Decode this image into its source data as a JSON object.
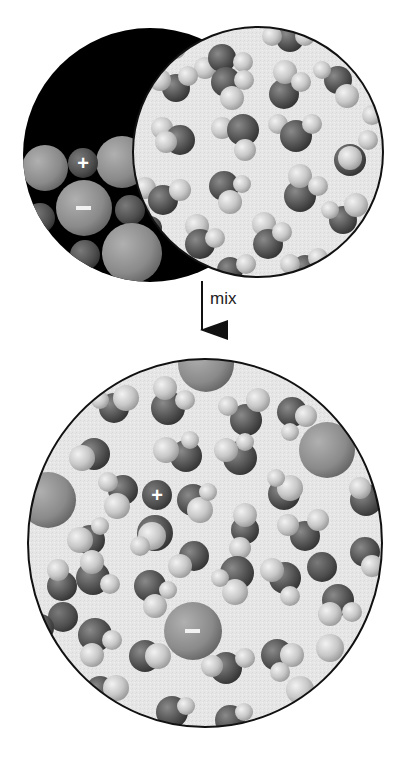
{
  "figure": {
    "type": "ionic-dissolution-diagram",
    "arrow_label": "mix",
    "colors": {
      "background": "#ffffff",
      "solid_background": "#000000",
      "solution_background": "#e6e6e6",
      "oxygen": "#555555",
      "hydrogen": "#cfcfcf",
      "anion": "#8a8a8a",
      "cation": "#505050",
      "outline": "#111111"
    },
    "top": {
      "solid_crystal": {
        "label": "ionic solid",
        "cation_symbol": "+",
        "anion_symbol": "−"
      },
      "water": {
        "label": "liquid water"
      }
    },
    "bottom": {
      "solution": {
        "label": "ions hydrated in water",
        "cation_symbol": "+",
        "anion_symbol": "−"
      }
    }
  }
}
